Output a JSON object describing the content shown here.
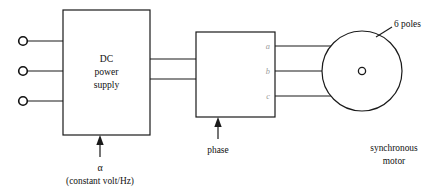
{
  "diagram": {
    "title_present": false,
    "colors": {
      "line": "#1a1a1a",
      "background": "#ffffff",
      "faint_label": "#9a9a9a"
    },
    "dc_block": {
      "line1": "DC",
      "line2": "power",
      "line3": "supply"
    },
    "dc_control": {
      "symbol": "α",
      "note": "(constant volt/Hz)"
    },
    "phase_block": {
      "label": "phase",
      "outputs": [
        "a",
        "b",
        "c"
      ]
    },
    "motor": {
      "poles_label": "6 poles",
      "name_line1": "synchronous",
      "name_line2": "motor"
    },
    "input_terminals": {
      "count": 3
    }
  }
}
